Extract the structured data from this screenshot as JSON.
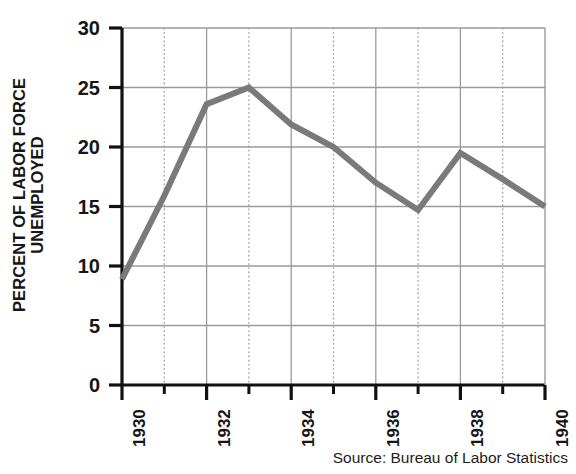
{
  "chart_data": {
    "type": "line",
    "title": "",
    "subtitle": "",
    "xlabel": "",
    "ylabel": "PERCENT OF LABOR FORCE UNEMPLOYED",
    "ylabel_lines": [
      "PERCENT OF LABOR FORCE",
      "UNEMPLOYED"
    ],
    "x": [
      1930,
      1931,
      1932,
      1933,
      1934,
      1935,
      1936,
      1937,
      1938,
      1939,
      1940
    ],
    "values": [
      8.9,
      15.9,
      23.6,
      25.0,
      21.9,
      20.0,
      17.0,
      14.7,
      19.5,
      17.3,
      15.0
    ],
    "series": [
      {
        "name": "Percent of labor force unemployed",
        "values": [
          8.9,
          15.9,
          23.6,
          25.0,
          21.9,
          20.0,
          17.0,
          14.7,
          19.5,
          17.3,
          15.0
        ]
      }
    ],
    "xlim": [
      1930,
      1940
    ],
    "ylim": [
      0,
      30
    ],
    "ytick_values": [
      0,
      5,
      10,
      15,
      20,
      25,
      30
    ],
    "ytick_labels": [
      "0",
      "5",
      "10",
      "15",
      "20",
      "25",
      "30"
    ],
    "xtick_values": [
      1930,
      1932,
      1934,
      1936,
      1938,
      1940
    ],
    "xtick_labels": [
      "1930",
      "1932",
      "1934",
      "1936",
      "1938",
      "1940"
    ],
    "xminor_values": [
      1931,
      1933,
      1935,
      1937,
      1939
    ],
    "grid": true,
    "grid_horizontal": true,
    "grid_vertical_major": true,
    "grid_vertical_minor_dotted": true,
    "legend": false,
    "legend_position": "none",
    "line_color": "#7a7a7a",
    "grid_color": "#9a9a9a",
    "axis_color": "#111111",
    "text_color": "#161616",
    "background_color": "#ffffff",
    "line_width": 6
  },
  "source": {
    "text": "Source: Bureau of Labor Statistics"
  }
}
